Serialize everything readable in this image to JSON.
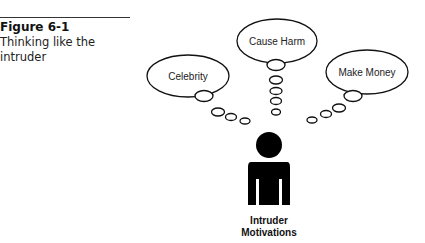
{
  "caption": {
    "figure_number": "Figure 6-1",
    "title": "Thinking like the intruder"
  },
  "diagram": {
    "thoughts": [
      {
        "label": "Celebrity"
      },
      {
        "label": "Cause Harm"
      },
      {
        "label": "Make Money"
      }
    ],
    "figure_icon": "person-silhouette-icon",
    "figure_label_line1": "Intruder",
    "figure_label_line2": "Motivations"
  }
}
